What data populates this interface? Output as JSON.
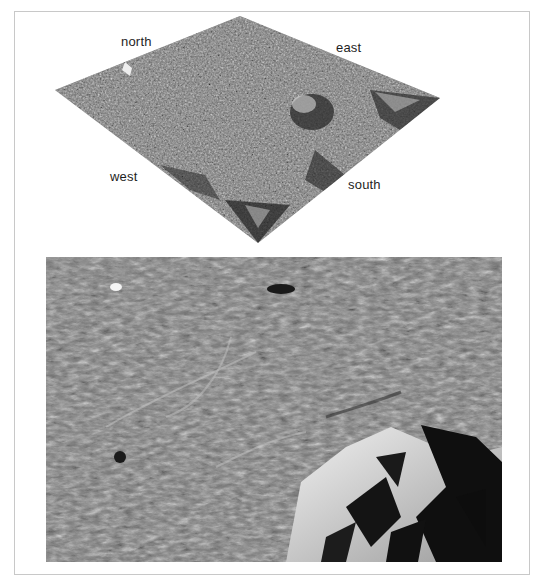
{
  "figure": {
    "top_panel": {
      "description": "3D perspective terrain model",
      "labels": {
        "north": "north",
        "east": "east",
        "west": "west",
        "south": "south"
      }
    },
    "bottom_panel": {
      "description": "Oblique close-up terrain image"
    }
  },
  "colors": {
    "background": "#ffffff",
    "frame_border": "#c8c8c8",
    "terrain_mid": "#7a7a7a",
    "terrain_shadow": "#141414",
    "terrain_highlight": "#e8e8e8",
    "label_text": "#1e1e1e"
  }
}
